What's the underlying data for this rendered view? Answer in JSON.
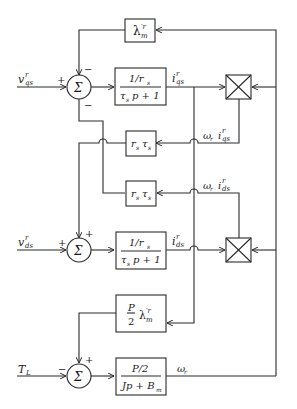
{
  "diagram": {
    "type": "block-diagram",
    "inputs": {
      "vqs": {
        "main": "v",
        "sup": "r",
        "sub": "qs"
      },
      "vds": {
        "main": "v",
        "sup": "r",
        "sub": "ds"
      },
      "TL": {
        "main": "T",
        "sub": "L"
      }
    },
    "summers": [
      {
        "id": "sum_q",
        "symbol": "Σ",
        "signs": {
          "left": "+",
          "top": "−",
          "bottom": "−"
        }
      },
      {
        "id": "sum_d",
        "symbol": "Σ",
        "signs": {
          "left": "+",
          "top": "+"
        }
      },
      {
        "id": "sum_m",
        "symbol": "Σ",
        "signs": {
          "left": "−",
          "top": "+"
        }
      }
    ],
    "blocks": {
      "lambda": {
        "main": "λ",
        "sup": "′r",
        "sub": "m"
      },
      "tf_q": {
        "num": "1/r",
        "num_sub": "s",
        "den_a": "τ",
        "den_sub": "s",
        "den_b": "p + 1"
      },
      "rt_upper": {
        "a": "r",
        "a_sub": "s",
        "b": "τ",
        "b_sub": "s"
      },
      "rt_lower": {
        "a": "r",
        "a_sub": "s",
        "b": "τ",
        "b_sub": "s"
      },
      "tf_d": {
        "num": "1/r",
        "num_sub": "s",
        "den_a": "τ",
        "den_sub": "s",
        "den_b": "p + 1"
      },
      "torque": {
        "frac_num": "P",
        "frac_den": "2",
        "main": "λ",
        "sup": "′r",
        "sub": "m"
      },
      "mech": {
        "num": "P/2",
        "den_a": "Jp + B",
        "den_sub": "m"
      }
    },
    "signals": {
      "iqs": {
        "main": "i",
        "sup": "r",
        "sub": "qs"
      },
      "ids": {
        "main": "i",
        "sup": "r",
        "sub": "ds"
      },
      "wr_iqs": {
        "w": "ω",
        "w_sub": "r",
        "main": "i",
        "sup": "r",
        "sub": "qs"
      },
      "wr_ids": {
        "w": "ω",
        "w_sub": "r",
        "main": "i",
        "sup": "r",
        "sub": "ds"
      },
      "wr": {
        "main": "ω",
        "sub": "r"
      }
    },
    "multipliers": [
      {
        "id": "mult_q",
        "symbol": "×"
      },
      {
        "id": "mult_d",
        "symbol": "×"
      }
    ]
  }
}
